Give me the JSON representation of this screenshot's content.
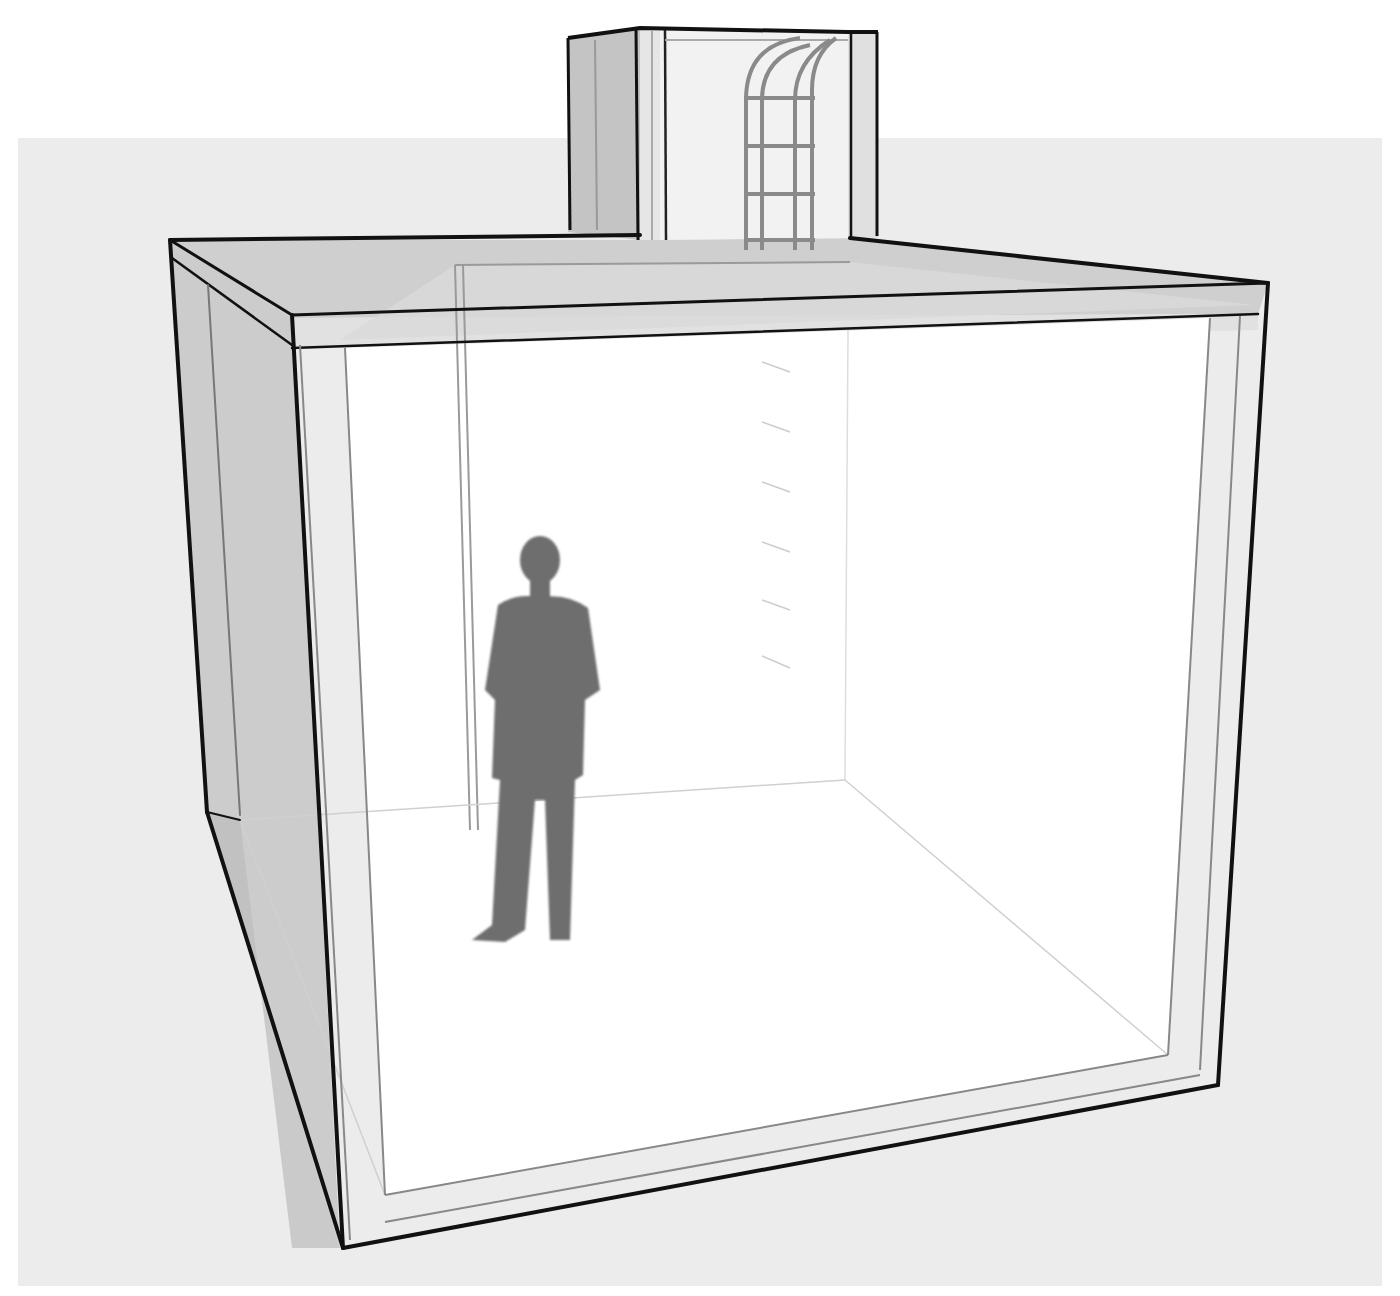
{
  "figure": {
    "type": "3d-architectural-sketch",
    "colors": {
      "background": "#ffffff",
      "ground": "#ececec",
      "wall_tint": "#bdbdbd",
      "edge": "#111111",
      "figure": "#6e6e6e",
      "interior": "#ffffff"
    },
    "elements": [
      {
        "name": "main-room-box",
        "description": "large glass box room"
      },
      {
        "name": "roof-slab",
        "description": "thick roof slab with opening"
      },
      {
        "name": "rooftop-enclosure",
        "description": "small box on roof containing stair"
      },
      {
        "name": "ladder",
        "description": "curved ladder/stair inside rooftop enclosure"
      },
      {
        "name": "human-figure",
        "description": "standing person silhouette for scale"
      },
      {
        "name": "wall-rungs",
        "description": "faint rung marks on interior wall"
      }
    ]
  }
}
